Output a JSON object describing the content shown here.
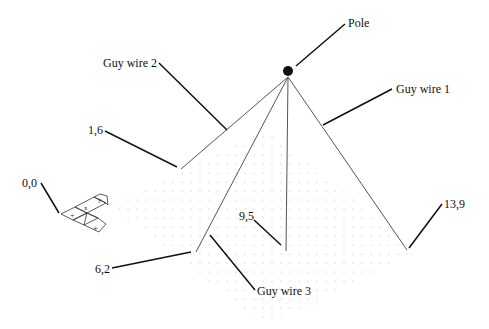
{
  "labels": {
    "pole": "Pole",
    "guy_wire_1": "Guy wire 1",
    "guy_wire_2": "Guy wire 2",
    "guy_wire_3": "Guy wire 3",
    "origin": "0,0",
    "p_1_6": "1,6",
    "p_6_2": "6,2",
    "p_9_5": "9,5",
    "p_13_9": "13,9"
  },
  "axis_glyphs": {
    "x": "+",
    "y": "+",
    "minus_y": "Y",
    "minus_x": "X"
  },
  "colors": {
    "ink": "#111111",
    "wire": "#555555",
    "grid_dot": "#b5b5b5"
  }
}
